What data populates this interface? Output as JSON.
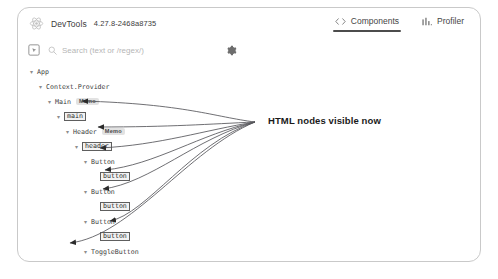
{
  "window": {
    "background": "#ffffff",
    "card_border_color": "#c9c9c9"
  },
  "header": {
    "logo_icon": "react-logo-icon",
    "app_name": "DevTools",
    "version": "4.27.8-2468a8735",
    "tabs": [
      {
        "id": "components",
        "label": "Components",
        "icon": "code-brackets-icon",
        "active": true
      },
      {
        "id": "profiler",
        "label": "Profiler",
        "icon": "bar-chart-icon",
        "active": false
      }
    ]
  },
  "toolbar": {
    "inspect_icon": "element-picker-icon",
    "search_icon": "search-icon",
    "search_placeholder": "Search (text or /regex/)",
    "search_value": "",
    "settings_icon": "gear-icon"
  },
  "tree": {
    "nodes": [
      {
        "depth": 0,
        "caret": "▾",
        "label": "App",
        "boxed": false,
        "badge": ""
      },
      {
        "depth": 1,
        "caret": "▾",
        "label": "Context.Provider",
        "boxed": false,
        "badge": ""
      },
      {
        "depth": 2,
        "caret": "▾",
        "label": "Main",
        "boxed": false,
        "badge": "Memo"
      },
      {
        "depth": 3,
        "caret": "▾",
        "label": "main",
        "boxed": true,
        "badge": ""
      },
      {
        "depth": 4,
        "caret": "▾",
        "label": "Header",
        "boxed": false,
        "badge": "Memo"
      },
      {
        "depth": 5,
        "caret": "▾",
        "label": "header",
        "boxed": true,
        "badge": ""
      },
      {
        "depth": 6,
        "caret": "▾",
        "label": "Button",
        "boxed": false,
        "badge": ""
      },
      {
        "depth": 7,
        "caret": "",
        "label": "button",
        "boxed": true,
        "badge": ""
      },
      {
        "depth": 6,
        "caret": "▾",
        "label": "Button",
        "boxed": false,
        "badge": ""
      },
      {
        "depth": 7,
        "caret": "",
        "label": "button",
        "boxed": true,
        "badge": ""
      },
      {
        "depth": 6,
        "caret": "▾",
        "label": "Button",
        "boxed": false,
        "badge": ""
      },
      {
        "depth": 7,
        "caret": "",
        "label": "button",
        "boxed": true,
        "badge": ""
      },
      {
        "depth": 6,
        "caret": "▾",
        "label": "ToggleButton",
        "boxed": false,
        "badge": ""
      },
      {
        "depth": 7,
        "caret": "▾",
        "label": "Button",
        "boxed": false,
        "badge": ""
      },
      {
        "depth": 8,
        "caret": "",
        "label": "button",
        "boxed": true,
        "badge": ""
      },
      {
        "depth": 4,
        "caret": "▾",
        "label": "Title",
        "boxed": false,
        "badge": "Memo"
      },
      {
        "depth": 5,
        "caret": "",
        "label": "h1",
        "boxed": true,
        "badge": ""
      }
    ]
  },
  "annotation": {
    "text": "HTML nodes visible now",
    "color": "#1a1a1a"
  }
}
